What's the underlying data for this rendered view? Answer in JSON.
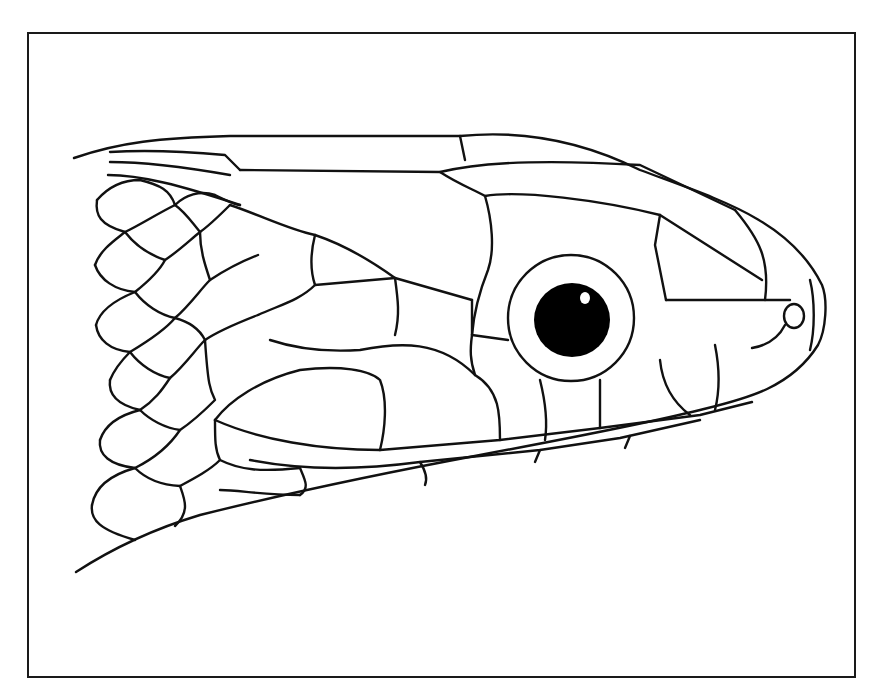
{
  "figure": {
    "border_color": "#1a1a1a",
    "line_color": "#111111",
    "background": "#ffffff",
    "eye": {
      "cx": 571,
      "cy": 318,
      "ring_rx": 63,
      "ring_ry": 63,
      "pupil_rx": 38,
      "pupil_ry": 37
    },
    "nostril": {
      "cx": 794,
      "cy": 316
    }
  }
}
